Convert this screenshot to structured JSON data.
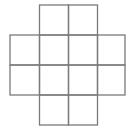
{
  "diagram": {
    "type": "grid-cross",
    "rows": [
      {
        "row": 0,
        "cols": [
          1,
          2
        ]
      },
      {
        "row": 1,
        "cols": [
          0,
          1,
          2,
          3
        ]
      },
      {
        "row": 2,
        "cols": [
          0,
          1,
          2,
          3
        ]
      },
      {
        "row": 3,
        "cols": [
          1,
          2
        ]
      }
    ],
    "cell_count": 12,
    "line_color": "#7a7a7a",
    "background": "#ffffff"
  }
}
